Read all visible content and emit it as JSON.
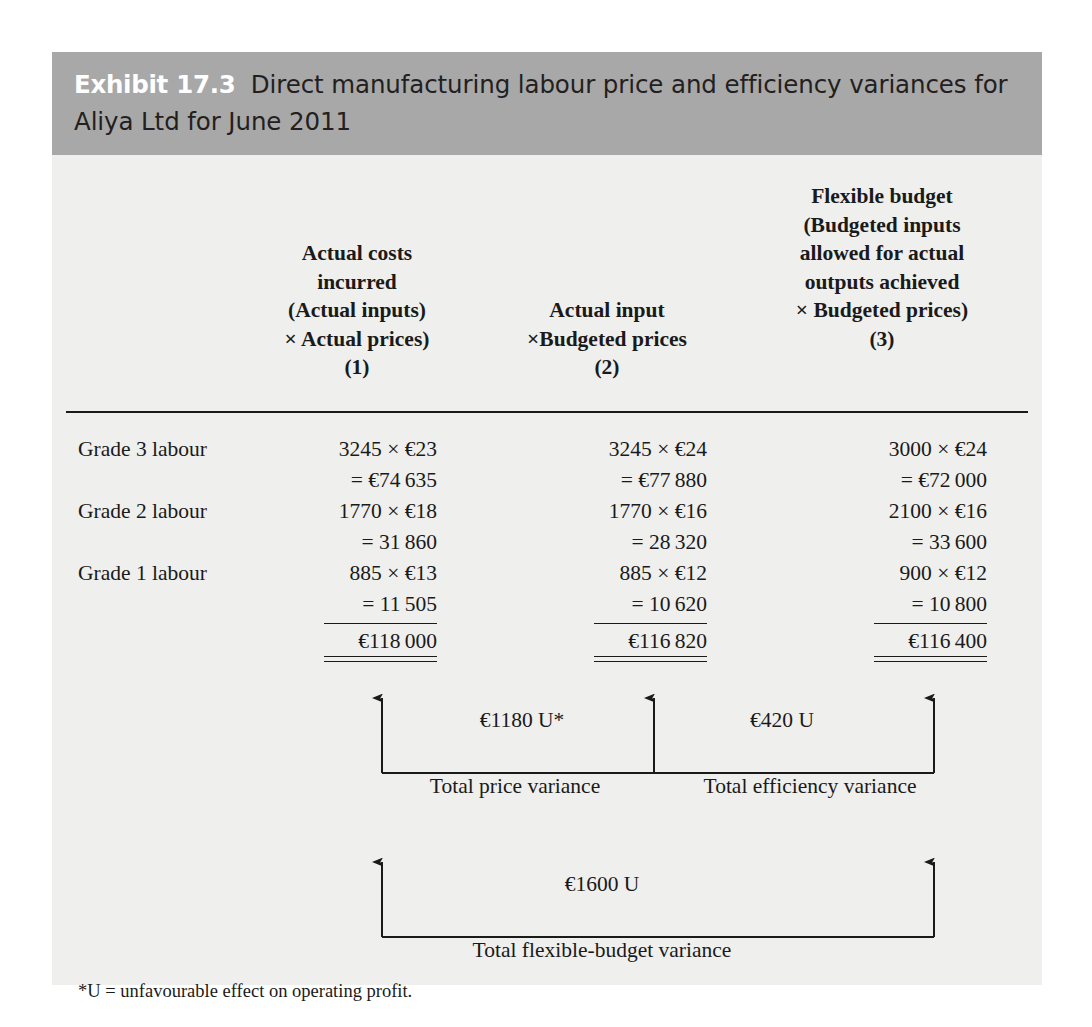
{
  "exhibit": {
    "number": "Exhibit 17.3",
    "title": "Direct manufacturing labour price and efficiency variances for Aliya Ltd for June 2011",
    "title_line1": "Direct manufacturing labour price and efficiency variances for",
    "title_line2": "Aliya Ltd for June 2011",
    "background_color": "#efefed",
    "header_band_color": "#a8a8a8",
    "header_number_color": "#ffffff",
    "text_color": "#1a1a1a"
  },
  "columns": [
    {
      "id": "col1",
      "number": "(1)",
      "lines": [
        "Actual costs",
        "incurred",
        "(Actual inputs)",
        "× Actual prices)",
        "(1)"
      ]
    },
    {
      "id": "col2",
      "number": "(2)",
      "lines": [
        "Actual input",
        "×Budgeted prices",
        "(2)"
      ]
    },
    {
      "id": "col3",
      "number": "(3)",
      "lines": [
        "Flexible budget",
        "(Budgeted inputs",
        "allowed for actual",
        "outputs achieved",
        "× Budgeted prices)",
        "(3)"
      ]
    }
  ],
  "rows": [
    {
      "label": "Grade 3 labour",
      "col1_calc": "3245 × €23",
      "col1_result": "= €74 635",
      "col2_calc": "3245 × €24",
      "col2_result": "= €77 880",
      "col3_calc": "3000 × €24",
      "col3_result": "= €72 000"
    },
    {
      "label": "Grade 2 labour",
      "col1_calc": "1770 × €18",
      "col1_result": "= 31 860",
      "col2_calc": "1770 × €16",
      "col2_result": "= 28 320",
      "col3_calc": "2100 × €16",
      "col3_result": "= 33 600"
    },
    {
      "label": "Grade 1 labour",
      "col1_calc": "885 × €13",
      "col1_result": "= 11 505",
      "col2_calc": "885 × €12",
      "col2_result": "= 10 620",
      "col3_calc": "900 × €12",
      "col3_result": "= 10 800"
    }
  ],
  "totals": {
    "col1": "€118 000",
    "col2": "€116 820",
    "col3": "€116 400"
  },
  "variances": {
    "price": {
      "amount": "€1180 U*",
      "name": "Total price variance"
    },
    "efficiency": {
      "amount": "€420 U",
      "name": "Total efficiency variance"
    },
    "flexible_budget": {
      "amount": "€1600 U",
      "name": "Total flexible-budget variance"
    }
  },
  "footnote": "*U = unfavourable effect on operating profit."
}
